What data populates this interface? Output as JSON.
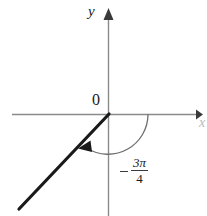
{
  "figure": {
    "type": "math-diagram",
    "background_color": "#ffffff",
    "axis_color": "#8a8a8a",
    "ray_color": "#1a1a1a",
    "arc_color": "#6e6e6e",
    "text_color": "#1a1a1a",
    "labels": {
      "y_axis": "y",
      "x_axis": "x",
      "origin": "0",
      "angle_sign": "−",
      "angle_numerator": "3π",
      "angle_denominator": "4",
      "angle_full": "−3π/4"
    },
    "geometry": {
      "origin": {
        "x": 108,
        "y": 114
      },
      "y_axis": {
        "x": 108,
        "top": 16,
        "bottom": 216,
        "arrow": "up"
      },
      "x_axis": {
        "y": 114,
        "left": 12,
        "right": 200,
        "arrow": "right"
      },
      "terminal_ray": {
        "from": {
          "x": 108,
          "y": 114
        },
        "to": {
          "x": 19,
          "y": 209
        },
        "angle_degrees": -135,
        "quadrant": 3,
        "stroke_width": 3
      },
      "angle_arc": {
        "radius": 40,
        "start_angle_degrees": 0,
        "end_angle_degrees": -135,
        "direction": "clockwise",
        "arrowhead_at": {
          "x": 82,
          "y": 146
        }
      }
    }
  }
}
